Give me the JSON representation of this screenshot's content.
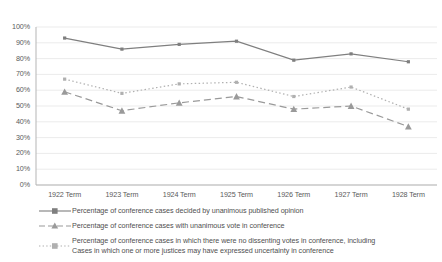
{
  "chart_data": {
    "type": "line",
    "title": "",
    "xlabel": "",
    "ylabel": "",
    "categories": [
      "1922 Term",
      "1923 Term",
      "1924 Term",
      "1925 Term",
      "1926 Term",
      "1927 Term",
      "1928 Term"
    ],
    "ylim": [
      0,
      100
    ],
    "ytick_labels": [
      "100%",
      "90%",
      "80%",
      "70%",
      "60%",
      "50%",
      "40%",
      "30%",
      "20%",
      "10%",
      "0%"
    ],
    "ytick_values": [
      100,
      90,
      80,
      70,
      60,
      50,
      40,
      30,
      20,
      10,
      0
    ],
    "grid": true,
    "legend_position": "bottom",
    "series": [
      {
        "name": "Percentage of conference cases decided by unanimous published opinion",
        "values": [
          93,
          86,
          89,
          91,
          79,
          83,
          78
        ],
        "line_style": "solid",
        "marker": "square",
        "color": "#7f7f7f"
      },
      {
        "name": "Percentage of conference cases with unanimous vote in conference",
        "values": [
          59,
          47,
          52,
          56,
          48,
          50,
          37
        ],
        "line_style": "dashed",
        "marker": "triangle",
        "color": "#9a9a9a"
      },
      {
        "name": "Percentage of conference cases in which there were no dissenting votes in conference, including Cases in which one or more justices may have expressed uncertainty in conference",
        "values": [
          67,
          58,
          64,
          65,
          56,
          62,
          48
        ],
        "line_style": "dotted",
        "marker": "square",
        "color": "#b0b0b0"
      }
    ]
  },
  "legend": {
    "items": [
      {
        "label": "Percentage of conference cases decided by unanimous published opinion",
        "label_line2": "",
        "key_icon": "solid-line-square-marker"
      },
      {
        "label": "Percentage of conference cases with unanimous vote in conference",
        "label_line2": "",
        "key_icon": "dashed-line-triangle-marker"
      },
      {
        "label": "Percentage of conference cases in which there were no dissenting votes in conference, including",
        "label_line2": "Cases in which one or more justices may have expressed uncertainty in conference",
        "key_icon": "dotted-line-square-marker"
      }
    ]
  },
  "colors": {
    "series_1": "#7f7f7f",
    "series_2": "#9a9a9a",
    "series_3": "#b0b0b0",
    "grid": "#e6e6e6",
    "axis": "#b5b5b5",
    "text": "#4f4f4f",
    "background": "#ffffff"
  }
}
